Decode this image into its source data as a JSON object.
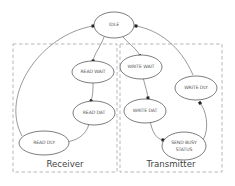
{
  "diagram": {
    "type": "state-machine",
    "groups": [
      {
        "id": "receiver",
        "label": "Receiver"
      },
      {
        "id": "transmitter",
        "label": "Transmitter"
      }
    ],
    "nodes": [
      {
        "id": "idle",
        "label": "IDLE"
      },
      {
        "id": "read_wait",
        "label": "READ WAIT",
        "group": "receiver"
      },
      {
        "id": "read_dat",
        "label": "READ DAT",
        "group": "receiver"
      },
      {
        "id": "read_dly",
        "label": "READ DLY",
        "group": "receiver"
      },
      {
        "id": "write_wait",
        "label": "WRITE WAIT",
        "group": "transmitter"
      },
      {
        "id": "write_dat",
        "label": "WRITE DAT",
        "group": "transmitter"
      },
      {
        "id": "send_busy_status",
        "label_line1": "SEND BUSY",
        "label_line2": "STATUS",
        "group": "transmitter"
      },
      {
        "id": "write_dly",
        "label": "WRITE DLY",
        "group": "transmitter"
      }
    ],
    "edges": [
      {
        "from": "idle",
        "to": "read_wait"
      },
      {
        "from": "idle",
        "to": "write_wait"
      },
      {
        "from": "read_wait",
        "to": "read_dat"
      },
      {
        "from": "read_dat",
        "to": "read_dly"
      },
      {
        "from": "read_dly",
        "to": "idle"
      },
      {
        "from": "write_wait",
        "to": "write_dat"
      },
      {
        "from": "write_dat",
        "to": "send_busy_status"
      },
      {
        "from": "send_busy_status",
        "to": "write_dly"
      },
      {
        "from": "write_dly",
        "to": "idle"
      }
    ]
  }
}
